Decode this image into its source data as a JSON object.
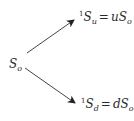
{
  "diagram": {
    "type": "binomial-tree-one-step",
    "root": {
      "symbol": "S",
      "sub": "o"
    },
    "up": {
      "pre": "1",
      "symbol": "S",
      "sub": "u",
      "eq": "=",
      "coef": "u",
      "rhs_symbol": "S",
      "rhs_sub": "o"
    },
    "down": {
      "pre": "1",
      "symbol": "S",
      "sub": "d",
      "eq": "=",
      "coef": "d",
      "rhs_symbol": "S",
      "rhs_sub": "o"
    },
    "colors": {
      "stroke": "#333333",
      "text": "#2a2a2a"
    }
  }
}
